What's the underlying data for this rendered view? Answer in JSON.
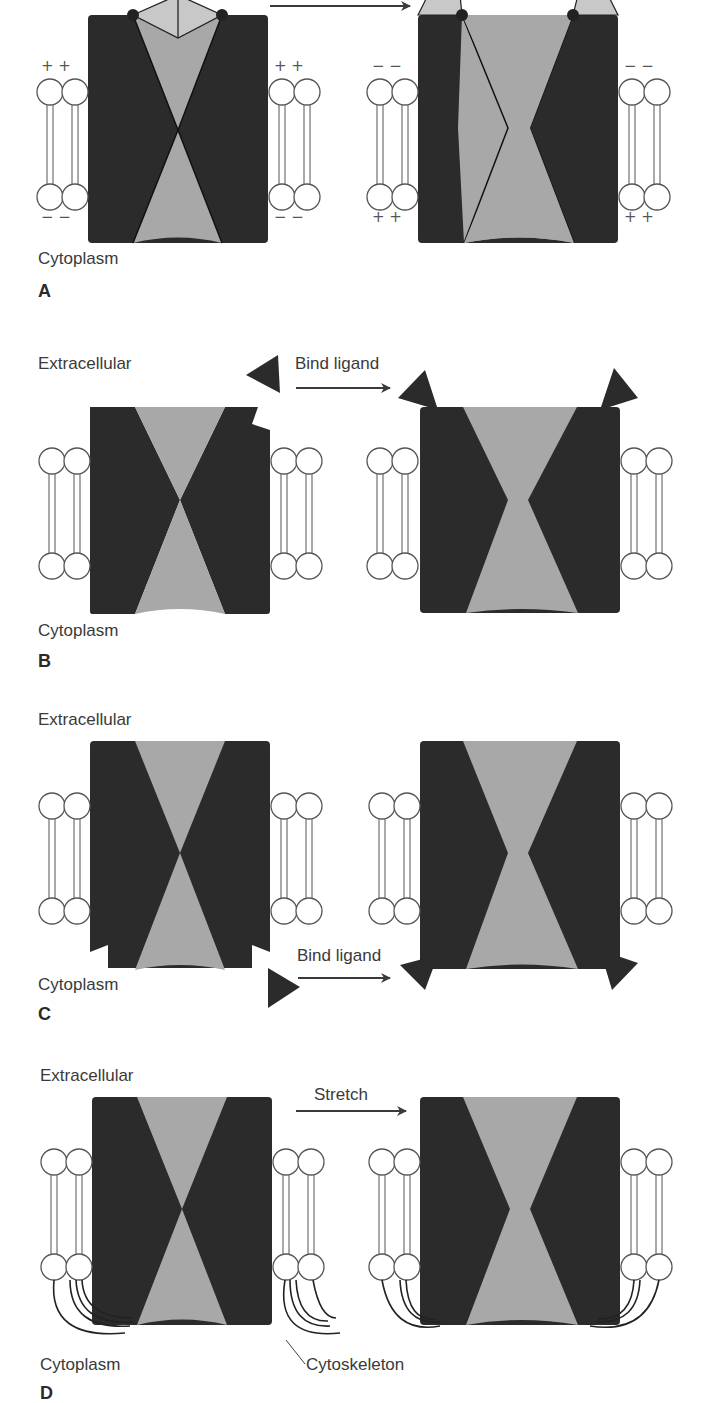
{
  "figure": {
    "colors": {
      "protein": "#2b2b2b",
      "pore": "#a8a8a8",
      "gate": "#c8c8c8",
      "lipid_stroke": "#555555",
      "arrow": "#3a3a3a"
    },
    "panels": [
      {
        "id": "A",
        "letter": "A",
        "mechanism": "voltage-gated",
        "top_label": "",
        "bottom_label": "Cytoplasm",
        "arrow_label": "",
        "closed_state_charges": {
          "top": "+ +",
          "bottom": "− −"
        },
        "open_state_charges": {
          "top": "− −",
          "bottom": "+ +"
        }
      },
      {
        "id": "B",
        "letter": "B",
        "mechanism": "extracellular ligand-gated",
        "top_label": "Extracellular",
        "bottom_label": "Cytoplasm",
        "arrow_label": "Bind ligand"
      },
      {
        "id": "C",
        "letter": "C",
        "mechanism": "intracellular ligand-gated",
        "top_label": "Extracellular",
        "bottom_label": "Cytoplasm",
        "arrow_label": "Bind ligand"
      },
      {
        "id": "D",
        "letter": "D",
        "mechanism": "mechanically gated",
        "top_label": "Extracellular",
        "bottom_label": "Cytoplasm",
        "arrow_label": "Stretch",
        "callout_label": "Cytoskeleton"
      }
    ]
  }
}
